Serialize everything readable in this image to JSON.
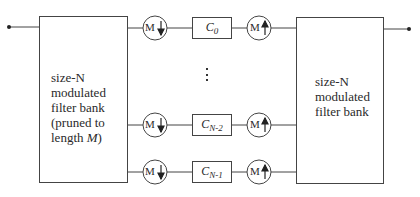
{
  "diagram": {
    "input_node": "input",
    "output_node": "output",
    "analysis_bank": {
      "lines": [
        "size-N",
        "modulated",
        "filter bank",
        "(pruned to",
        "length "
      ],
      "length_symbol": "M",
      "close": ")"
    },
    "synthesis_bank": {
      "lines": [
        "size-N",
        "modulated",
        "filter bank"
      ]
    },
    "downsampler_label": "M",
    "upsampler_label": "M",
    "ellipsis": "⋮",
    "branches": [
      {
        "coef": "C",
        "sub": "0"
      },
      {
        "coef": "C",
        "sub": "N-2"
      },
      {
        "coef": "C",
        "sub": "N-1"
      }
    ],
    "colors": {
      "stroke": "#3a3a3a",
      "text": "#2a2a2a",
      "background": "#ffffff"
    }
  }
}
